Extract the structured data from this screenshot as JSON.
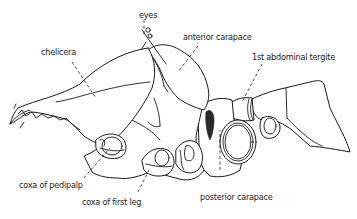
{
  "figure": {
    "labels": {
      "eyes": "eyes",
      "chelicera": "chelicera",
      "anterior_carapace": "anterior carapace",
      "first_abdominal_tergite": "1st abdominal tergite",
      "coxa_of_pedipalp": "coxa of pedipalp",
      "coxa_of_first_leg": "coxa of first leg",
      "posterior_carapace": "posterior carapace"
    }
  },
  "colors": {
    "ink": "#1a1a1a",
    "background": "#ffffff"
  }
}
